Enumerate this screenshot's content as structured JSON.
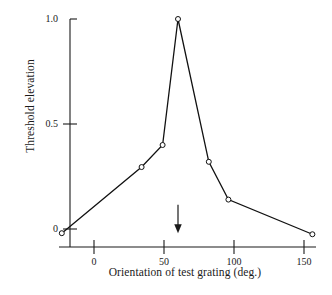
{
  "chart_data": {
    "type": "line",
    "title": "",
    "subtitle": "",
    "xlabel": "Orientation of test grating (deg.)",
    "ylabel": "Threshold elevation",
    "x": [
      -23,
      34,
      49,
      60,
      82,
      96,
      156
    ],
    "y": [
      -0.02,
      0.295,
      0.4,
      1.0,
      0.32,
      0.14,
      -0.025
    ],
    "series": [
      {
        "name": "Threshold elevation",
        "x": [
          -23,
          34,
          49,
          60,
          82,
          96,
          156
        ],
        "values": [
          -0.02,
          0.295,
          0.4,
          1.0,
          0.32,
          0.14,
          -0.025
        ]
      }
    ],
    "xlim": [
      -33,
      166
    ],
    "ylim": [
      -0.09,
      1.06
    ],
    "xticks": [
      0,
      50,
      100,
      150
    ],
    "xtick_labels": [
      "0",
      "50",
      "100",
      "150"
    ],
    "yticks": [
      0,
      0.5,
      1.0
    ],
    "ytick_labels": [
      "0",
      "0.5",
      "1.0"
    ],
    "grid": false,
    "legend": "none",
    "marker": "open-circle",
    "line_color": "#111111",
    "marker_edge_color": "#111111",
    "marker_face_color": "#ffffff",
    "annotations": [
      {
        "name": "adaptation-orientation-arrow",
        "type": "arrow",
        "direction": "down",
        "x": 60,
        "y_from": 0.115,
        "y_to": -0.02,
        "label": ""
      }
    ]
  },
  "axes": {
    "y_axis_name": "threshold-elevation-axis",
    "x_axis_name": "orientation-axis"
  }
}
